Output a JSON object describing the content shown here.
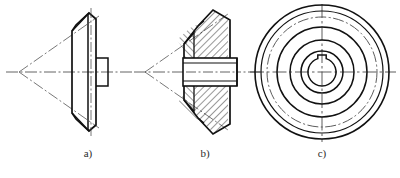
{
  "figure": {
    "background_color": "#ffffff",
    "line_color": "#1a1a1a",
    "centerline_color": "#555555",
    "hatch_color": "#1a1a1a",
    "width": 400,
    "height": 178
  },
  "captions": {
    "a": "a)",
    "b": "b)",
    "c": "c)"
  },
  "views": [
    {
      "id": "a",
      "name": "outline-view",
      "caption": "a)",
      "description": "External outline view of bevel gear, axis horizontal, cone apex at left",
      "caption_x": 88,
      "caption_y": 156,
      "axis_y": 72,
      "apex_x": 18,
      "centerline_left": 6,
      "centerline_right": 130,
      "body": {
        "front_face_x": 96,
        "back_face_x": 72,
        "top_y": 18,
        "bottom_y": 128,
        "bevel_top_y": 30,
        "bevel_bottom_y": 116
      },
      "hub": {
        "x": 96,
        "width": 12,
        "y": 58,
        "height": 28
      }
    },
    {
      "id": "b",
      "name": "section-view",
      "caption": "b)",
      "description": "Full sectional view of bevel gear with 45 degree cross hatching and central bore",
      "caption_x": 205,
      "caption_y": 156,
      "axis_y": 72,
      "apex_x": 142,
      "centerline_left": 132,
      "centerline_right": 258,
      "body": {
        "front_face_x": 228,
        "back_face_x": 188,
        "top_y": 16,
        "bottom_y": 130
      },
      "bore": {
        "x": 186,
        "width": 50,
        "y": 58,
        "height": 28
      },
      "hatch_angle_deg": 45,
      "hatch_spacing": 4
    },
    {
      "id": "c",
      "name": "front-circular-view",
      "caption": "c)",
      "description": "Front view showing concentric circles: addendum circle, dash-dot pitch circle, dedendum circle, hub circle, bore circle with keyway at top",
      "caption_x": 322,
      "caption_y": 156,
      "center_x": 322,
      "center_y": 72,
      "centerline_h": {
        "x1": 248,
        "x2": 396
      },
      "centerline_v": {
        "y1": 4,
        "y2": 142
      },
      "circles": [
        {
          "name": "addendum-circle",
          "r": 67,
          "style": "solid",
          "stroke_width": 1.5
        },
        {
          "name": "rim-circle",
          "r": 61,
          "style": "solid",
          "stroke_width": 1.2
        },
        {
          "name": "pitch-circle",
          "r": 55,
          "style": "dash-dot",
          "stroke_width": 1.0
        },
        {
          "name": "dedendum-circle",
          "r": 45,
          "style": "solid",
          "stroke_width": 1.4
        },
        {
          "name": "web-circle",
          "r": 32,
          "style": "solid",
          "stroke_width": 1.4
        },
        {
          "name": "hub-outer-circle",
          "r": 21,
          "style": "solid",
          "stroke_width": 1.4
        },
        {
          "name": "bore-circle",
          "r": 14,
          "style": "solid",
          "stroke_width": 1.4
        }
      ],
      "keyway": {
        "name": "keyway-slot",
        "width": 9,
        "depth": 5,
        "position": "top"
      }
    }
  ]
}
